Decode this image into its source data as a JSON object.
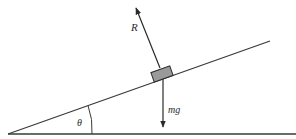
{
  "diagram": {
    "type": "inclined-plane-force-diagram",
    "labels": {
      "normal_force": "R",
      "weight": "mg",
      "angle": "θ"
    },
    "colors": {
      "line": "#3a3a3a",
      "block_fill": "#9a9a9a",
      "block_stroke": "#2a2a2a",
      "background": "#ffffff"
    }
  }
}
